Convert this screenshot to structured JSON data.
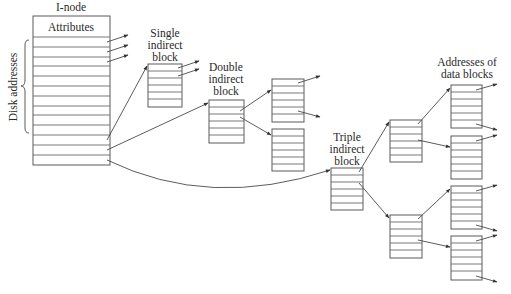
{
  "title": "I-node",
  "inode": {
    "label": "I-node",
    "header": "Attributes",
    "side_label": "Disk addresses",
    "address_rows": 13
  },
  "blocks": {
    "single_indirect": [
      "Single",
      "indirect",
      "block"
    ],
    "double_indirect": [
      "Double",
      "indirect",
      "block"
    ],
    "triple_indirect": [
      "Triple",
      "indirect",
      "block"
    ],
    "data_addresses": [
      "Addresses of",
      "data blocks"
    ]
  },
  "colors": {
    "line": "#5a5a5a",
    "text": "#2a2a2a",
    "background": "#ffffff"
  }
}
